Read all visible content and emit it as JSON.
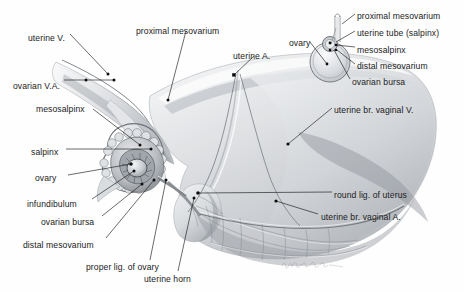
{
  "figure": {
    "width": 464,
    "height": 292,
    "background_color": "#fefefe",
    "ink_color": "#1b1b1b",
    "shading_color": "#b9bcc0",
    "signature": "artist signature (cursive, faint)"
  },
  "main_labels": [
    {
      "id": "uterine-v",
      "text": "uterine V.",
      "x": 28,
      "y": 33,
      "align": "left"
    },
    {
      "id": "proximal-mesovarium",
      "text": "proximal mesovarium",
      "x": 136,
      "y": 26,
      "align": "left"
    },
    {
      "id": "uterine-a",
      "text": "uterine A.",
      "x": 233,
      "y": 51,
      "align": "left"
    },
    {
      "id": "ovarian-va",
      "text": "ovarian V.A.",
      "x": 13,
      "y": 81,
      "align": "left"
    },
    {
      "id": "mesosalpinx",
      "text": "mesosalpinx",
      "x": 36,
      "y": 104,
      "align": "left"
    },
    {
      "id": "salpinx",
      "text": "salpinx",
      "x": 31,
      "y": 147,
      "align": "left"
    },
    {
      "id": "ovary",
      "text": "ovary",
      "x": 35,
      "y": 173,
      "align": "left"
    },
    {
      "id": "infundibulum",
      "text": "infundibulum",
      "x": 27,
      "y": 199,
      "align": "left"
    },
    {
      "id": "ovarian-bursa",
      "text": "ovarian bursa",
      "x": 41,
      "y": 217,
      "align": "left"
    },
    {
      "id": "distal-mesovarium",
      "text": "distal mesovarium",
      "x": 23,
      "y": 240,
      "align": "left"
    },
    {
      "id": "proper-lig-of-ovary",
      "text": "proper lig. of ovary",
      "x": 86,
      "y": 262,
      "align": "left"
    },
    {
      "id": "uterine-horn",
      "text": "uterine horn",
      "x": 144,
      "y": 274,
      "align": "left"
    },
    {
      "id": "uterine-br-vaginal-v",
      "text": "uterine br. vaginal V.",
      "x": 334,
      "y": 105,
      "align": "left"
    },
    {
      "id": "round-lig-of-uterus",
      "text": "round lig. of uterus",
      "x": 334,
      "y": 190,
      "align": "left"
    },
    {
      "id": "uterine-br-vaginal-a",
      "text": "uterine br. vaginal A.",
      "x": 321,
      "y": 212,
      "align": "left"
    }
  ],
  "inset_labels": [
    {
      "id": "inset-ovary",
      "text": "ovary",
      "x": 289,
      "y": 38,
      "align": "left"
    },
    {
      "id": "inset-proximal-mesovarium",
      "text": "proximal mesovarium",
      "x": 357,
      "y": 11,
      "align": "left"
    },
    {
      "id": "inset-uterine-tube",
      "text": "uterine tube (salpinx)",
      "x": 357,
      "y": 28,
      "align": "left"
    },
    {
      "id": "inset-mesosalpinx",
      "text": "mesosalpinx",
      "x": 357,
      "y": 45,
      "align": "left"
    },
    {
      "id": "inset-distal-mesovarium",
      "text": "distal mesovarium",
      "x": 357,
      "y": 61,
      "align": "left"
    },
    {
      "id": "inset-ovarian-bursa",
      "text": "ovarian bursa",
      "x": 352,
      "y": 77,
      "align": "left"
    }
  ]
}
